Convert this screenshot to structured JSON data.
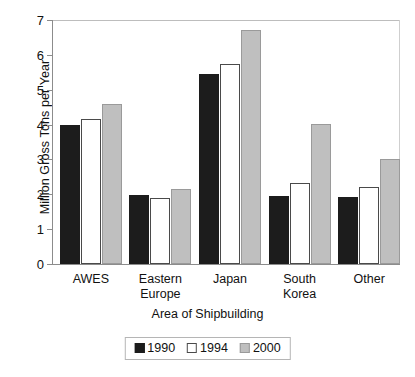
{
  "chart_data": {
    "type": "bar",
    "title": "",
    "xlabel": "Area of Shipbuilding",
    "ylabel": "Million Gross Tons per Year",
    "categories": [
      "AWES",
      "Eastern\nEurope",
      "Japan",
      "South\nKorea",
      "Other"
    ],
    "series": [
      {
        "name": "1990",
        "color": "#1c1c1c",
        "values": [
          4.0,
          1.98,
          5.45,
          1.95,
          1.92
        ]
      },
      {
        "name": "1994",
        "color": "#ffffff",
        "values": [
          4.15,
          1.9,
          5.75,
          2.32,
          2.2
        ]
      },
      {
        "name": "2000",
        "color": "#bfbfbf",
        "values": [
          4.58,
          2.15,
          6.72,
          4.03,
          3.02
        ]
      }
    ],
    "ylim": [
      0,
      7
    ],
    "yticks": [
      0,
      1,
      2,
      3,
      4,
      5,
      6,
      7
    ],
    "ytick_labels": [
      "0",
      "1",
      "2",
      "3",
      "4",
      "5",
      "6",
      "7"
    ],
    "grid": false,
    "legend_position": "bottom-center"
  },
  "legend": {
    "entries": [
      {
        "label": "1990",
        "swatch": "black-square-icon"
      },
      {
        "label": "1994",
        "swatch": "white-square-icon"
      },
      {
        "label": "2000",
        "swatch": "gray-square-icon"
      }
    ]
  }
}
